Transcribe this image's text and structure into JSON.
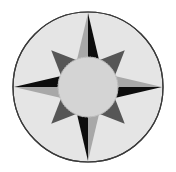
{
  "figure": {
    "name": "compass-rose",
    "type": "illustration",
    "canvas": {
      "width": 176,
      "height": 172
    },
    "background_color": "#ffffff"
  },
  "disc": {
    "label": "outer-disc",
    "center_x": 88,
    "center_y": 87,
    "radius": 75,
    "fill": "#e5e5e5",
    "stroke": "#3a3a3a",
    "stroke_width": 1.2
  },
  "hub": {
    "label": "center-hub-circle",
    "center_x": 88,
    "center_y": 87,
    "radius": 30,
    "fill": "#d4d4d4",
    "stroke": "#c0c0c0",
    "stroke_width": 0.8,
    "edge_style": "stippled"
  },
  "palette": {
    "black": "#0d0d0d",
    "light_gray": "#a8a8a8",
    "mid_dark_gray": "#565656",
    "disc_gray": "#e5e5e5",
    "hub_gray": "#d4d4d4",
    "outline": "#3a3a3a",
    "white": "#ffffff"
  },
  "star": {
    "label": "eight-point-star",
    "point_count": 8,
    "cardinal_tip_radius": 74,
    "diagonal_tip_radius": 52,
    "base_half_width_deg": 22.5,
    "base_radius": 29,
    "cardinal_points": [
      {
        "name": "north-point",
        "abbr": "N",
        "angle_deg": 0,
        "tip_x": 88,
        "tip_y": 13,
        "left_half_fill": "#a8a8a8",
        "right_half_fill": "#0d0d0d"
      },
      {
        "name": "east-point",
        "abbr": "E",
        "angle_deg": 90,
        "tip_x": 162,
        "tip_y": 87,
        "left_half_fill": "#a8a8a8",
        "right_half_fill": "#0d0d0d"
      },
      {
        "name": "south-point",
        "abbr": "S",
        "angle_deg": 180,
        "tip_x": 88,
        "tip_y": 161,
        "left_half_fill": "#a8a8a8",
        "right_half_fill": "#0d0d0d"
      },
      {
        "name": "west-point",
        "abbr": "W",
        "angle_deg": 270,
        "tip_x": 14,
        "tip_y": 87,
        "left_half_fill": "#a8a8a8",
        "right_half_fill": "#0d0d0d"
      }
    ],
    "diagonal_points": [
      {
        "name": "northeast-point",
        "abbr": "NE",
        "angle_deg": 45,
        "tip_x": 125,
        "tip_y": 50,
        "fill": "#565656"
      },
      {
        "name": "southeast-point",
        "abbr": "SE",
        "angle_deg": 135,
        "tip_x": 125,
        "tip_y": 124,
        "fill": "#565656"
      },
      {
        "name": "southwest-point",
        "abbr": "SW",
        "angle_deg": 225,
        "tip_x": 51,
        "tip_y": 124,
        "fill": "#565656"
      },
      {
        "name": "northwest-point",
        "abbr": "NW",
        "angle_deg": 315,
        "tip_x": 51,
        "tip_y": 50,
        "fill": "#565656"
      }
    ]
  }
}
